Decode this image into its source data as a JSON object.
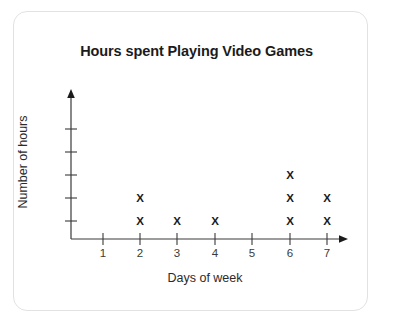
{
  "chart_data": {
    "type": "scatter",
    "title": "Hours spent Playing Video Games",
    "xlabel": "Days of week",
    "ylabel": "Number of hours",
    "categories": [
      "1",
      "2",
      "3",
      "4",
      "5",
      "6",
      "7"
    ],
    "values": [
      0,
      2,
      1,
      1,
      0,
      3,
      2
    ],
    "marker": "x",
    "grid": false,
    "legend": null,
    "xlim": [
      0,
      8
    ],
    "ylim": [
      0,
      5
    ],
    "x_ticks": [
      "1",
      "2",
      "3",
      "4",
      "5",
      "6",
      "7"
    ],
    "y_ticks": [
      "",
      "",
      "",
      "",
      ""
    ]
  },
  "card": {
    "border_color": "#e2e2e2",
    "background": "#ffffff"
  },
  "axes": {
    "axis_color": "#3a3a3a",
    "marker_color": "#1b1b1b",
    "x_arrow": "arrow-right",
    "y_arrow": "arrow-up"
  }
}
